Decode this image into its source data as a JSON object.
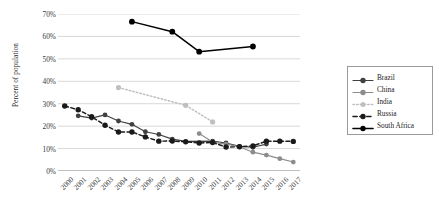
{
  "chart_data": {
    "type": "line",
    "title": "",
    "xlabel": "",
    "ylabel": "Percent of population",
    "ylim": [
      0,
      70
    ],
    "ytick_labels": [
      "0%",
      "10%",
      "20%",
      "30%",
      "40%",
      "50%",
      "60%",
      "70%"
    ],
    "ytick_values": [
      0,
      10,
      20,
      30,
      40,
      50,
      60,
      70
    ],
    "grid": true,
    "legend_position": "right",
    "x": [
      2000,
      2001,
      2002,
      2003,
      2004,
      2005,
      2006,
      2007,
      2008,
      2009,
      2010,
      2011,
      2012,
      2013,
      2014,
      2015,
      2016,
      2017
    ],
    "xtick_labels": [
      "2000",
      "2001",
      "2002",
      "2003",
      "2004",
      "2005",
      "2006",
      "2007",
      "2008",
      "2009",
      "2010",
      "2011",
      "2012",
      "2013",
      "2014",
      "2015",
      "2016",
      "2017"
    ],
    "series": [
      {
        "name": "Brazil",
        "color": "#404040",
        "style": "solid",
        "marker": "circle",
        "points": [
          {
            "x": 2001,
            "y": 24.6
          },
          {
            "x": 2002,
            "y": 23.6
          },
          {
            "x": 2003,
            "y": 25.0
          },
          {
            "x": 2004,
            "y": 22.3
          },
          {
            "x": 2005,
            "y": 20.8
          },
          {
            "x": 2006,
            "y": 17.5
          },
          {
            "x": 2007,
            "y": 16.3
          },
          {
            "x": 2008,
            "y": 14.2
          },
          {
            "x": 2009,
            "y": 13.2
          },
          {
            "x": 2011,
            "y": 13.3
          },
          {
            "x": 2012,
            "y": 12.5
          },
          {
            "x": 2013,
            "y": 11.0
          },
          {
            "x": 2014,
            "y": 10.6
          },
          {
            "x": 2015,
            "y": 12.0
          }
        ]
      },
      {
        "name": "China",
        "color": "#8c8c8c",
        "style": "solid",
        "marker": "circle",
        "points": [
          {
            "x": 2010,
            "y": 16.7
          },
          {
            "x": 2011,
            "y": 12.9
          },
          {
            "x": 2012,
            "y": 12.0
          },
          {
            "x": 2013,
            "y": 10.8
          },
          {
            "x": 2014,
            "y": 8.4
          },
          {
            "x": 2015,
            "y": 7.1
          },
          {
            "x": 2016,
            "y": 5.5
          },
          {
            "x": 2017,
            "y": 4.0
          }
        ]
      },
      {
        "name": "India",
        "color": "#bfbfbf",
        "style": "dotted",
        "marker": "circle",
        "points": [
          {
            "x": 2004,
            "y": 37.2
          },
          {
            "x": 2009,
            "y": 29.3
          },
          {
            "x": 2011,
            "y": 21.9
          }
        ]
      },
      {
        "name": "Russia",
        "color": "#1a1a1a",
        "style": "dashed",
        "marker": "circle",
        "points": [
          {
            "x": 2000,
            "y": 29.0
          },
          {
            "x": 2001,
            "y": 27.3
          },
          {
            "x": 2002,
            "y": 24.2
          },
          {
            "x": 2003,
            "y": 20.4
          },
          {
            "x": 2004,
            "y": 17.4
          },
          {
            "x": 2005,
            "y": 17.4
          },
          {
            "x": 2006,
            "y": 15.2
          },
          {
            "x": 2007,
            "y": 13.3
          },
          {
            "x": 2008,
            "y": 13.4
          },
          {
            "x": 2009,
            "y": 13.0
          },
          {
            "x": 2010,
            "y": 12.5
          },
          {
            "x": 2011,
            "y": 12.7
          },
          {
            "x": 2012,
            "y": 10.7
          },
          {
            "x": 2013,
            "y": 10.8
          },
          {
            "x": 2014,
            "y": 11.2
          },
          {
            "x": 2015,
            "y": 13.3
          },
          {
            "x": 2016,
            "y": 13.3
          },
          {
            "x": 2017,
            "y": 13.2
          }
        ]
      },
      {
        "name": "South Africa",
        "color": "#000000",
        "style": "solid",
        "marker": "circle",
        "points": [
          {
            "x": 2005,
            "y": 66.6
          },
          {
            "x": 2008,
            "y": 62.1
          },
          {
            "x": 2010,
            "y": 53.2
          },
          {
            "x": 2014,
            "y": 55.5
          }
        ]
      }
    ]
  },
  "legend": {
    "items": [
      {
        "label": "Brazil"
      },
      {
        "label": "China"
      },
      {
        "label": "India"
      },
      {
        "label": "Russia"
      },
      {
        "label": "South Africa"
      }
    ]
  }
}
